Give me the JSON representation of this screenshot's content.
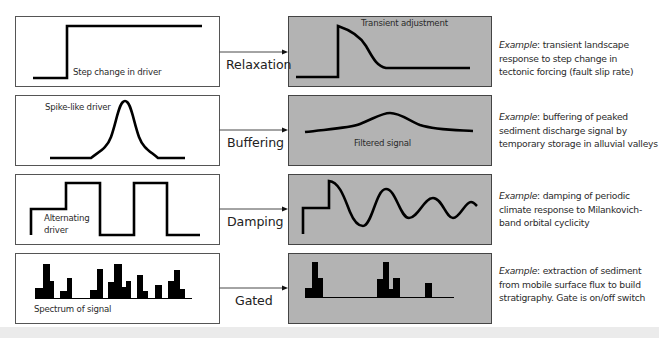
{
  "rows": [
    {
      "process": "Relaxation",
      "driver_label": "Step change in driver",
      "response_label": "Transient adjustment",
      "example_prefix": "Example",
      "example_text": ": transient landscape response to step change in tectonic forcing (fault slip rate)",
      "example_lines": [
        "Example: transient landscape",
        "response to step change in",
        "tectonic forcing (fault slip rate)"
      ]
    },
    {
      "process": "Buffering",
      "driver_label": "Spike-like driver",
      "response_label": "Filtered signal",
      "example_prefix": "Example",
      "example_text": ": buffering of peaked sediment discharge signal by temporary storage in alluvial valleys",
      "example_lines": [
        "Example: buffering of peaked",
        "sediment discharge signal by",
        "temporary storage in alluvial valleys"
      ]
    },
    {
      "process": "Damping",
      "driver_label_line1": "Alternating",
      "driver_label_line2": "driver",
      "example_prefix": "Example",
      "example_text": ": damping of periodic climate response to Milankovich-band orbital cyclicity",
      "example_lines": [
        "Example: damping of periodic",
        "climate response to Milankovich-",
        "band orbital cyclicity"
      ]
    },
    {
      "process": "Gated",
      "driver_label": "Spectrum of signal",
      "example_prefix": "Example",
      "example_text": ": extraction of sediment from mobile surface flux to build stratigraphy. Gate is on/off switch",
      "example_lines": [
        "Example: extraction of sediment",
        "from mobile surface flux to build",
        "stratigraphy. Gate is on/off switch"
      ]
    }
  ],
  "colors": {
    "response_box_fill": "#b3b3b3",
    "line": "#000000",
    "box_border": "#555555",
    "bottom_band": "#ebebeb"
  }
}
